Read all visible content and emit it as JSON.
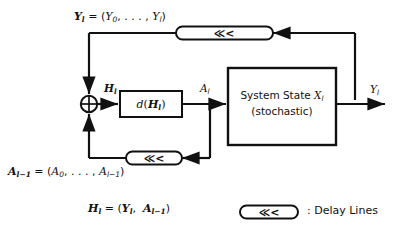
{
  "figure": {
    "background_color": "#ffffff",
    "line_color": "#111111"
  },
  "labels": {
    "y_history": "Y_l = (Y_0, ..., Y_l)",
    "a_history": "A_{l-1} = (A_0, ..., A_{l-1})",
    "h_definition": "H_l = (Y_l, A_{l-1})",
    "h_signal": "H_l",
    "a_signal": "A_l",
    "y_output": "Y_l"
  },
  "blocks": {
    "decision": {
      "name": "decision-function-block",
      "label": "d(H_l)"
    },
    "system": {
      "name": "system-state-block",
      "line1": "System State X_l",
      "line2": "(stochastic)"
    },
    "summing_junction": {
      "name": "summing-junction",
      "glyph": "crossed-circle"
    }
  },
  "delay_lines": {
    "top": {
      "name": "delay-line-top",
      "glyph": "<<<"
    },
    "bottom": {
      "name": "delay-line-bottom",
      "glyph": "<<<"
    }
  },
  "legend": {
    "symbol_glyph": "<<<",
    "text": ": Delay Lines"
  }
}
